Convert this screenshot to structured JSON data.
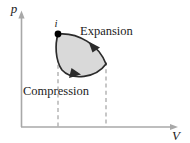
{
  "figure": {
    "name": "pressure-volume-cycle-diagram",
    "background_color": "#ffffff",
    "width": 190,
    "height": 143
  },
  "axes": {
    "vertical": {
      "label": "p",
      "name": "pressure-axis",
      "color": "#a8a8a8",
      "origin": [
        21,
        127
      ],
      "end": [
        21,
        14
      ]
    },
    "horizontal": {
      "label": "V",
      "name": "volume-axis",
      "color": "#a8a8a8",
      "origin": [
        21,
        127
      ],
      "end": [
        180,
        127
      ]
    }
  },
  "points": [
    {
      "label": "i",
      "name": "initial-state-point",
      "x": 58,
      "y": 34,
      "color": "#000000"
    }
  ],
  "processes": [
    {
      "label": "Expansion",
      "name": "expansion-process-label",
      "direction": "clockwise-upper-branch",
      "text_x": 80,
      "text_y": 35
    },
    {
      "label": "Compression",
      "name": "compression-process-label",
      "direction": "clockwise-lower-branch",
      "text_x": 23,
      "text_y": 95
    }
  ],
  "cycle": {
    "name": "thermodynamic-cycle-loop",
    "fill_color": "#d9d9d9",
    "stroke_color": "#2b2b2b",
    "shape": "lens",
    "bounds": {
      "left": 58,
      "right": 106,
      "top": 33,
      "bottom": 80
    }
  },
  "guides": [
    {
      "name": "left-volume-guide",
      "x": 58,
      "y_top": 34,
      "y_bottom": 127,
      "style": "dashed"
    },
    {
      "name": "right-volume-guide",
      "x": 106,
      "y_top": 63,
      "y_bottom": 127,
      "style": "dashed"
    }
  ]
}
